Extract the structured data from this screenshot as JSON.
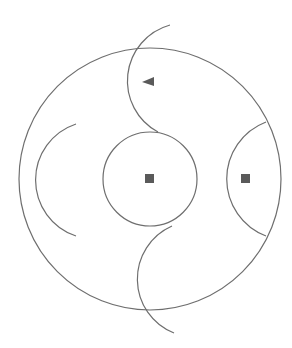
{
  "diagram": {
    "background": "#ffffff",
    "stroke_color": "#6e6e6e",
    "fill_color": "#5a5a5a",
    "outer_circle": {
      "cx": 150,
      "cy": 179,
      "r": 131
    },
    "inner_circle": {
      "cx": 150,
      "cy": 179,
      "r": 47
    },
    "arcs": [
      {
        "name": "top-arc",
        "path": "M 170 25 A 58 58 0 0 0 158 132"
      },
      {
        "name": "bottom-arc",
        "path": "M 172 226 A 58 58 0 0 0 174 333"
      },
      {
        "name": "left-arc",
        "path": "M 76 124 A 59 59 0 0 0 76 236"
      },
      {
        "name": "right-arc",
        "path": "M 266 122 A 61 61 0 0 0 266 236"
      }
    ],
    "markers": [
      {
        "name": "triangle-marker",
        "shape": "triangle",
        "points": "142,82 154,77 154,86"
      },
      {
        "name": "center-square-marker",
        "shape": "square",
        "x": 145,
        "y": 174,
        "size": 9
      },
      {
        "name": "right-square-marker",
        "shape": "square",
        "x": 241,
        "y": 174,
        "size": 9
      }
    ]
  }
}
